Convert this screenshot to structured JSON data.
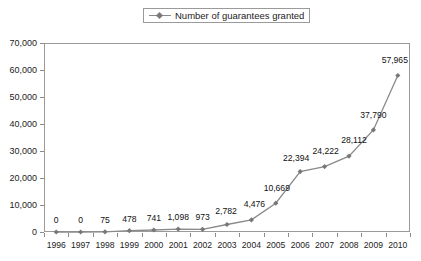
{
  "legend": {
    "label": "Number of guarantees granted",
    "marker_icon": "line-diamond-marker-icon",
    "position": "top-center"
  },
  "axes": {
    "y_ticks": [
      "0",
      "10,000",
      "20,000",
      "30,000",
      "40,000",
      "50,000",
      "60,000",
      "70,000"
    ],
    "x_ticks": [
      "1996",
      "1997",
      "1998",
      "1999",
      "2000",
      "2001",
      "2002",
      "2003",
      "2004",
      "2005",
      "2006",
      "2007",
      "2008",
      "2009",
      "2010"
    ]
  },
  "colors": {
    "line": "#8a8a8a",
    "marker": "#787878",
    "axis": "#9a9a9a",
    "text": "#111111",
    "background": "#ffffff"
  },
  "chart_data": {
    "type": "line",
    "title": "",
    "subtitle": "",
    "xlabel": "",
    "ylabel": "",
    "categories": [
      "1996",
      "1997",
      "1998",
      "1999",
      "2000",
      "2001",
      "2002",
      "2003",
      "2004",
      "2005",
      "2006",
      "2007",
      "2008",
      "2009",
      "2010"
    ],
    "series": [
      {
        "name": "Number of guarantees granted",
        "values": [
          0,
          0,
          75,
          478,
          741,
          1098,
          973,
          2782,
          4476,
          10669,
          22394,
          24222,
          28112,
          37790,
          57965
        ],
        "labels": [
          "0",
          "0",
          "75",
          "478",
          "741",
          "1,098",
          "973",
          "2,782",
          "4,476",
          "10,669",
          "22,394",
          "24,222",
          "28,112",
          "37,790",
          "57,965"
        ],
        "marker": "diamond",
        "color": "#8a8a8a"
      }
    ],
    "ylim": [
      0,
      70000
    ],
    "ytick_values": [
      0,
      10000,
      20000,
      30000,
      40000,
      50000,
      60000,
      70000
    ],
    "grid": false,
    "legend": true,
    "legend_position": "top-center",
    "data_labels": true
  }
}
